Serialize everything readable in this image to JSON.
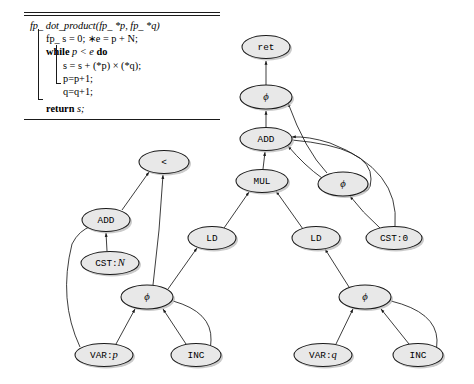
{
  "figure": {
    "kind": "ssa-dataflow-graph",
    "background": "#ffffff",
    "node_fill": "#e8e8e8",
    "node_stroke": "#1a1a1a"
  },
  "algorithm": {
    "signature_parts": {
      "type_prefix": "fp_",
      "name": "dot_product",
      "params": "(fp_ *p, fp_ *q)"
    },
    "lines": [
      "fp_ s = 0; *e = p + N;",
      "while p < e do",
      "s = s + (*p) × (*q);",
      "p=p+1;",
      "q=q+1;",
      "return s;"
    ],
    "line1": "fp_ s = 0; ∗e = p + N;",
    "line2_kw": "while",
    "line2_cond": "p < e",
    "line2_do": "do",
    "line3": "s = s + (*p) × (*q);",
    "line4": "p=p+1;",
    "line5": "q=q+1;",
    "line6_kw": "return",
    "line6_val": "s;"
  },
  "graph": {
    "nodes": [
      {
        "id": "ret",
        "label": "ret",
        "style": "mono",
        "cx": 266,
        "cy": 47,
        "rx": 24,
        "ry": 11.5
      },
      {
        "id": "phi_s",
        "label": "ϕ",
        "style": "ital",
        "cx": 266,
        "cy": 97,
        "rx": 26,
        "ry": 12
      },
      {
        "id": "add_s",
        "label": "ADD",
        "style": "mono",
        "cx": 266,
        "cy": 139,
        "rx": 26,
        "ry": 11.5
      },
      {
        "id": "mul",
        "label": "MUL",
        "style": "mono",
        "cx": 262,
        "cy": 181,
        "rx": 26,
        "ry": 11.5
      },
      {
        "id": "phi_r",
        "label": "ϕ",
        "style": "ital",
        "cx": 343,
        "cy": 184,
        "rx": 25,
        "ry": 12
      },
      {
        "id": "cst0",
        "label": "CST:0",
        "style": "mono",
        "cx": 394,
        "cy": 238,
        "rx": 28,
        "ry": 11.5
      },
      {
        "id": "lt",
        "label": "<",
        "style": "mono",
        "cx": 164,
        "cy": 162,
        "rx": 25,
        "ry": 11.5
      },
      {
        "id": "add_e",
        "label": "ADD",
        "style": "mono",
        "cx": 106,
        "cy": 220,
        "rx": 24,
        "ry": 11.5
      },
      {
        "id": "cstN",
        "label": "CST:N",
        "style": "serif",
        "cx": 110,
        "cy": 263,
        "rx": 29,
        "ry": 11.5
      },
      {
        "id": "ld_p",
        "label": "LD",
        "style": "mono",
        "cx": 212,
        "cy": 238,
        "rx": 24,
        "ry": 11.5
      },
      {
        "id": "ld_q",
        "label": "LD",
        "style": "mono",
        "cx": 316,
        "cy": 238,
        "rx": 24,
        "ry": 11.5
      },
      {
        "id": "phi_p",
        "label": "ϕ",
        "style": "ital",
        "cx": 147,
        "cy": 297,
        "rx": 26,
        "ry": 12
      },
      {
        "id": "phi_q",
        "label": "ϕ",
        "style": "ital",
        "cx": 365,
        "cy": 297,
        "rx": 26,
        "ry": 12
      },
      {
        "id": "var_p",
        "label": "VAR:p",
        "style": "serif",
        "cx": 104,
        "cy": 355,
        "rx": 29,
        "ry": 11.5
      },
      {
        "id": "inc_p",
        "label": "INC",
        "style": "mono",
        "cx": 196,
        "cy": 355,
        "rx": 25,
        "ry": 11.5
      },
      {
        "id": "var_q",
        "label": "VAR:q",
        "style": "serif",
        "cx": 323,
        "cy": 355,
        "rx": 29,
        "ry": 11.5
      },
      {
        "id": "inc_q",
        "label": "INC",
        "style": "mono",
        "cx": 418,
        "cy": 355,
        "rx": 25,
        "ry": 11.5
      }
    ],
    "edges": [
      {
        "from": "phi_s",
        "to": "ret"
      },
      {
        "from": "add_s",
        "to": "phi_s"
      },
      {
        "from": "phi_r",
        "to": "phi_s"
      },
      {
        "from": "mul",
        "to": "add_s"
      },
      {
        "from": "phi_r",
        "to": "add_s"
      },
      {
        "from": "cst0",
        "to": "phi_r"
      },
      {
        "from": "add_s",
        "to": "phi_r"
      },
      {
        "from": "cst0",
        "to": "add_s"
      },
      {
        "from": "ld_p",
        "to": "mul"
      },
      {
        "from": "ld_q",
        "to": "mul"
      },
      {
        "from": "add_e",
        "to": "lt"
      },
      {
        "from": "phi_p",
        "to": "lt"
      },
      {
        "from": "cstN",
        "to": "add_e"
      },
      {
        "from": "var_p",
        "to": "add_e"
      },
      {
        "from": "phi_p",
        "to": "ld_p"
      },
      {
        "from": "phi_q",
        "to": "ld_q"
      },
      {
        "from": "var_p",
        "to": "phi_p"
      },
      {
        "from": "inc_p",
        "to": "phi_p"
      },
      {
        "from": "phi_p",
        "to": "inc_p"
      },
      {
        "from": "var_q",
        "to": "phi_q"
      },
      {
        "from": "inc_q",
        "to": "phi_q"
      },
      {
        "from": "phi_q",
        "to": "inc_q"
      }
    ]
  }
}
